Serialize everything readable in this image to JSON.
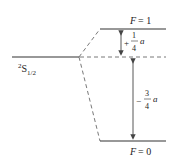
{
  "diagram": {
    "type": "hyperfine-splitting",
    "state_label": {
      "base": "S",
      "superscript": "2",
      "subscript": "1/2"
    },
    "levels": [
      {
        "name": "upper",
        "label": "F = 1",
        "F_var": "F",
        "F_value": "= 1"
      },
      {
        "name": "lower",
        "label": "F = 0",
        "F_var": "F",
        "F_value": "= 0"
      }
    ],
    "shifts": [
      {
        "name": "upper-shift",
        "sign": "+",
        "numerator": "1",
        "denominator": "4",
        "symbol": "a"
      },
      {
        "name": "lower-shift",
        "sign": "−",
        "numerator": "3",
        "denominator": "4",
        "symbol": "a"
      }
    ],
    "colors": {
      "line": "#333333",
      "arrow": "#444444",
      "dashed": "#555555"
    }
  }
}
